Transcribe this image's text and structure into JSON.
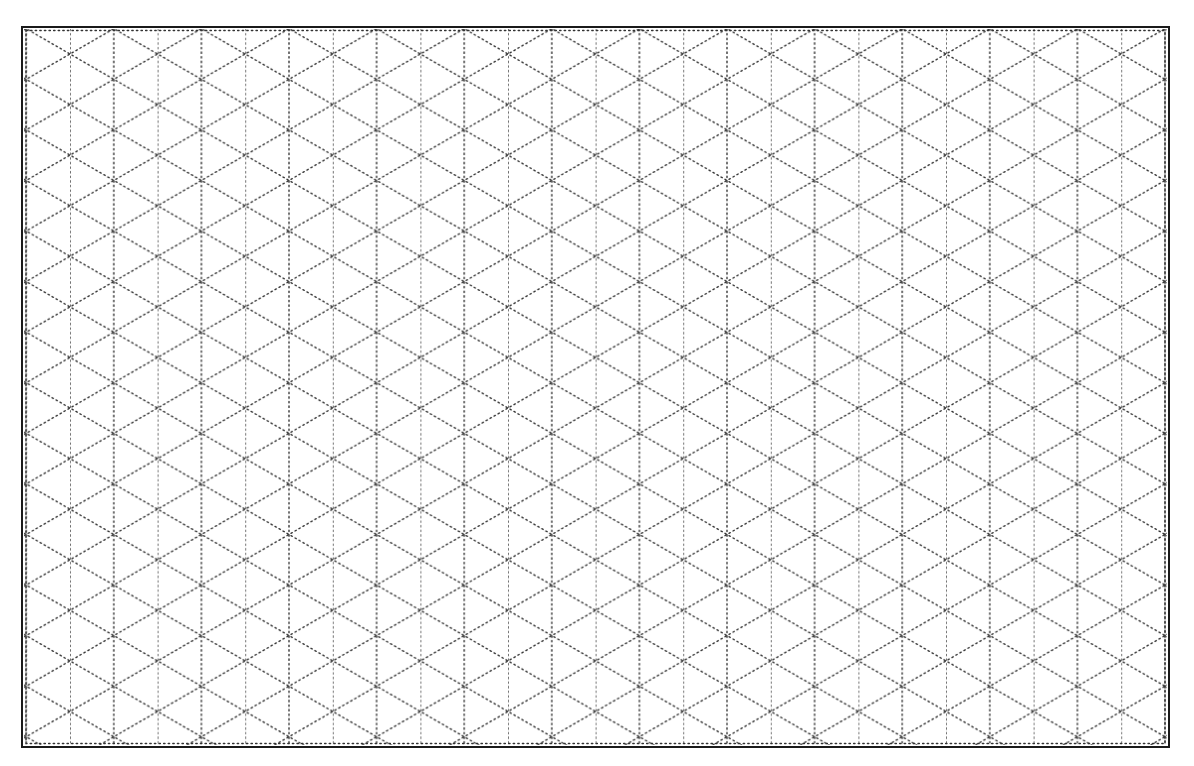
{
  "diagram": {
    "type": "isometric-dot-grid",
    "colors": {
      "background": "#ffffff",
      "border": "#1a1a1a",
      "dots": "#333333"
    },
    "frame": {
      "x": 22,
      "y": 27,
      "width": 1147,
      "height": 720
    },
    "grid": {
      "vertical_spacing_px": 43.8,
      "first_vertical_x": 70,
      "vertical_line_count": 25,
      "diagonal_angle_deg": 30,
      "first_crossing_y": 54,
      "line_style": "dotted"
    }
  }
}
